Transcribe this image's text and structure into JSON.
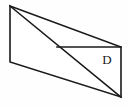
{
  "figure": {
    "kind": "geometry-diagram",
    "canvas": {
      "width": 129,
      "height": 107
    },
    "colors": {
      "background": "#fefefe",
      "stroke": "#1a1a1a",
      "fill": "#ffffff",
      "label": "#1a1a1a"
    },
    "stroke_width": 1.6,
    "vertices": {
      "top_left": {
        "x": 10,
        "y": 6
      },
      "mid_left_bottom": {
        "x": 10,
        "y": 62
      },
      "bottom_right": {
        "x": 121,
        "y": 97
      },
      "top_right": {
        "x": 121,
        "y": 47
      },
      "diagonal_crossing": {
        "x": 57,
        "y": 47
      }
    },
    "outline_path": "M 10 6 L 121 47 L 121 97 L 10 62 Z",
    "diagonal_path": "M 10 6 L 121 97",
    "upper_edge_path": "M 57 47 L 121 47",
    "regions": [
      {
        "name": "region-d",
        "label": "D",
        "label_position": {
          "x": 107,
          "y": 61
        },
        "shape": "triangle",
        "path": "M 57 47 L 121 47 L 121 97 Z"
      },
      {
        "name": "region-unlabeled-upper",
        "label": "",
        "shape": "triangle",
        "path": "M 10 6 L 57 47 L 10 62 Z"
      }
    ]
  }
}
